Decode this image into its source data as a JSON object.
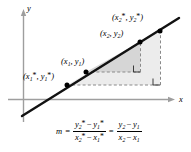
{
  "figure": {
    "type": "coordinate-diagram",
    "background_color": "#ffffff",
    "line_color": "#000000",
    "axis_color": "#9a9a9a",
    "dash_color": "#8c8c8c",
    "inner_triangle_fill": "#d8d8d8",
    "outer_triangle_fill": "#ececec"
  },
  "axes": {
    "x_label": "x",
    "y_label": "y"
  },
  "points": [
    {
      "id": "p1-star",
      "label": {
        "open": "(",
        "x_var": "x",
        "x_sub": "1",
        "x_star": "*",
        "comma": ", ",
        "y_var": "y",
        "y_sub": "1",
        "y_star": "*",
        "close": ")"
      },
      "label_text": "(x1*, y1*)",
      "cx": 67,
      "cy": 85
    },
    {
      "id": "p1",
      "label": {
        "open": "(",
        "x_var": "x",
        "x_sub": "1",
        "x_star": "",
        "comma": ", ",
        "y_var": "y",
        "y_sub": "1",
        "y_star": "",
        "close": ")"
      },
      "label_text": "(x1, y1)",
      "cx": 86,
      "cy": 72
    },
    {
      "id": "p2",
      "label": {
        "open": "(",
        "x_var": "x",
        "x_sub": "2",
        "x_star": "",
        "comma": ", ",
        "y_var": "y",
        "y_sub": "2",
        "y_star": "",
        "close": ")"
      },
      "label_text": "(x2, y2)",
      "cx": 140,
      "cy": 42
    },
    {
      "id": "p2-star",
      "label": {
        "open": "(",
        "x_var": "x",
        "x_sub": "2",
        "x_star": "*",
        "comma": ", ",
        "y_var": "y",
        "y_sub": "2",
        "y_star": "*",
        "close": ")"
      },
      "label_text": "(x2*, y2*)",
      "cx": 160,
      "cy": 31
    }
  ],
  "formula": {
    "lhs": "m",
    "equals_1": "=",
    "equals_2": "=",
    "fraction_1": {
      "numerator": {
        "a_var": "y",
        "a_sub": "2",
        "a_star": "*",
        "minus": "−",
        "b_var": "y",
        "b_sub": "1",
        "b_star": "*"
      },
      "denominator": {
        "a_var": "x",
        "a_sub": "2",
        "a_star": "*",
        "minus": "−",
        "b_var": "x",
        "b_sub": "1",
        "b_star": "*"
      },
      "numerator_text": "y2* − y1*",
      "denominator_text": "x2* − x1*"
    },
    "fraction_2": {
      "numerator": {
        "a_var": "y",
        "a_sub": "2",
        "a_star": "",
        "minus": "−",
        "b_var": "y",
        "b_sub": "1",
        "b_star": ""
      },
      "denominator": {
        "a_var": "x",
        "a_sub": "2",
        "a_star": "",
        "minus": "−",
        "b_var": "x",
        "b_sub": "1",
        "b_star": ""
      },
      "numerator_text": "y2 − y1",
      "denominator_text": "x2 − x1"
    },
    "full_text": "m = (y2* − y1*)/(x2* − x1*) = (y2 − y1)/(x2 − x1)"
  },
  "right_angle_markers": [
    {
      "id": "inner-right-angle",
      "x": 140,
      "y": 72
    },
    {
      "id": "outer-right-angle",
      "x": 160,
      "y": 85
    }
  ]
}
